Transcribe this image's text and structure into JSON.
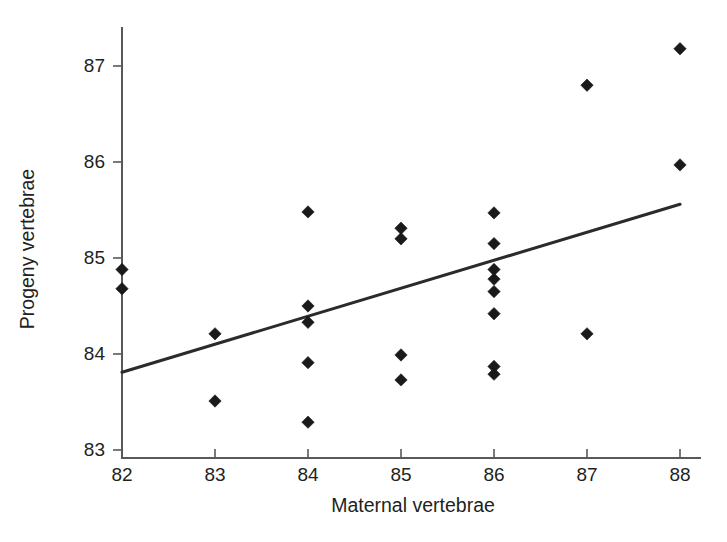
{
  "chart_data": {
    "type": "scatter",
    "title": "",
    "xlabel": "Maternal vertebrae",
    "ylabel": "Progeny vertebrae",
    "xlim": [
      81.55,
      88.25
    ],
    "ylim": [
      82.8,
      87.45
    ],
    "xticks": [
      82,
      83,
      84,
      85,
      86,
      87,
      88
    ],
    "xticklabels": [
      "82",
      "83",
      "84",
      "85",
      "86",
      "87",
      "88"
    ],
    "yticks": [
      83,
      84,
      85,
      86,
      87
    ],
    "yticklabels": [
      "83",
      "84",
      "85",
      "86",
      "87"
    ],
    "grid": false,
    "legend": null,
    "marker": "diamond",
    "marker_color": "#1a1a1a",
    "line_color": "#2b2b2b",
    "axis_color": "#58595b",
    "points": [
      {
        "x": 82,
        "y": 84.88
      },
      {
        "x": 82,
        "y": 84.68
      },
      {
        "x": 83,
        "y": 84.21
      },
      {
        "x": 83,
        "y": 83.51
      },
      {
        "x": 84,
        "y": 85.48
      },
      {
        "x": 84,
        "y": 84.5
      },
      {
        "x": 84,
        "y": 84.33
      },
      {
        "x": 84,
        "y": 83.91
      },
      {
        "x": 84,
        "y": 83.29
      },
      {
        "x": 85,
        "y": 85.31
      },
      {
        "x": 85,
        "y": 85.2
      },
      {
        "x": 85,
        "y": 83.99
      },
      {
        "x": 85,
        "y": 83.73
      },
      {
        "x": 86,
        "y": 85.47
      },
      {
        "x": 86,
        "y": 85.15
      },
      {
        "x": 86,
        "y": 84.88
      },
      {
        "x": 86,
        "y": 84.78
      },
      {
        "x": 86,
        "y": 84.65
      },
      {
        "x": 86,
        "y": 84.42
      },
      {
        "x": 86,
        "y": 83.87
      },
      {
        "x": 86,
        "y": 83.79
      },
      {
        "x": 87,
        "y": 86.8
      },
      {
        "x": 87,
        "y": 84.21
      },
      {
        "x": 88,
        "y": 87.18
      },
      {
        "x": 88,
        "y": 85.97
      }
    ],
    "trend_line": {
      "name": "regression line",
      "x": [
        82,
        88
      ],
      "y": [
        83.81,
        85.56
      ]
    }
  }
}
